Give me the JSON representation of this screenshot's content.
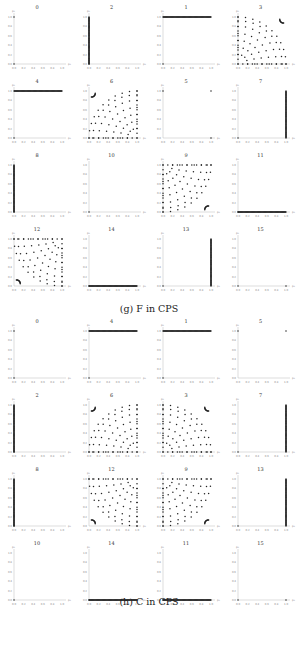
{
  "figure_g": {
    "caption": "(g) F in CPS",
    "panel_titles": [
      "0",
      "2",
      "1",
      "3",
      "4",
      "6",
      "5",
      "7",
      "8",
      "10",
      "9",
      "11",
      "12",
      "14",
      "13",
      "15"
    ]
  },
  "figure_h": {
    "caption": "(h) C in CPS",
    "panel_titles": [
      "0",
      "4",
      "1",
      "5",
      "2",
      "6",
      "3",
      "7",
      "8",
      "12",
      "9",
      "13",
      "10",
      "14",
      "11",
      "15"
    ]
  },
  "axes": {
    "x_label": "p₁",
    "y_label": "p₂",
    "x_ticks": [
      "0.0",
      "0.2",
      "0.4",
      "0.6",
      "0.8",
      "1.0"
    ],
    "y_ticks": [
      "0.0",
      "0.2",
      "0.4",
      "0.6",
      "0.8",
      "1.0"
    ]
  },
  "chart_data": [
    {
      "type": "scatter",
      "title": "(g) F in CPS",
      "xlabel": "p1",
      "ylabel": "p2",
      "xlim": [
        0,
        1
      ],
      "ylim": [
        0,
        1
      ],
      "grid": false,
      "panels": [
        {
          "title": "0",
          "pattern": "two corner points",
          "points": [
            [
              0,
              1
            ],
            [
              0,
              0
            ]
          ]
        },
        {
          "title": "2",
          "pattern": "vertical line x=0",
          "points": [
            [
              0,
              0
            ],
            [
              0,
              1
            ]
          ]
        },
        {
          "title": "1",
          "pattern": "horizontal line y=1",
          "points": [
            [
              0,
              1
            ],
            [
              1,
              1
            ]
          ]
        },
        {
          "title": "3",
          "pattern": "quarter-circle arcs concentrated near (1,1)",
          "points": []
        },
        {
          "title": "4",
          "pattern": "horizontal line y=1",
          "points": [
            [
              0,
              1
            ],
            [
              1,
              1
            ]
          ]
        },
        {
          "title": "6",
          "pattern": "quarter-circle arcs concentrated near (0,1)",
          "points": []
        },
        {
          "title": "5",
          "pattern": "corner points",
          "points": [
            [
              0,
              1
            ],
            [
              1,
              1
            ],
            [
              1,
              0
            ]
          ]
        },
        {
          "title": "7",
          "pattern": "vertical line x=1",
          "points": [
            [
              1,
              0
            ],
            [
              1,
              1
            ]
          ]
        },
        {
          "title": "8",
          "pattern": "vertical line x=0",
          "points": [
            [
              0,
              0
            ],
            [
              0,
              1
            ]
          ]
        },
        {
          "title": "10",
          "pattern": "single corner point",
          "points": [
            [
              0,
              0
            ]
          ]
        },
        {
          "title": "9",
          "pattern": "quarter-circle arcs concentrated near (1,0)",
          "points": []
        },
        {
          "title": "11",
          "pattern": "horizontal line y=0",
          "points": [
            [
              0,
              0
            ],
            [
              1,
              0
            ]
          ]
        },
        {
          "title": "12",
          "pattern": "quarter-circle arcs concentrated near (0,0)",
          "points": []
        },
        {
          "title": "14",
          "pattern": "horizontal line y=0",
          "points": [
            [
              0,
              0
            ],
            [
              1,
              0
            ]
          ]
        },
        {
          "title": "13",
          "pattern": "vertical line x=1",
          "points": [
            [
              1,
              0
            ],
            [
              1,
              1
            ]
          ]
        },
        {
          "title": "15",
          "pattern": "two corner points",
          "points": [
            [
              0,
              0
            ],
            [
              1,
              0
            ]
          ]
        }
      ]
    },
    {
      "type": "scatter",
      "title": "(h) C in CPS",
      "xlabel": "p1",
      "ylabel": "p2",
      "xlim": [
        0,
        1
      ],
      "ylim": [
        0,
        1
      ],
      "grid": false,
      "panels": [
        {
          "title": "0",
          "pattern": "two corner points",
          "points": [
            [
              0,
              1
            ],
            [
              0,
              0
            ]
          ]
        },
        {
          "title": "4",
          "pattern": "horizontal line y=1",
          "points": [
            [
              0,
              1
            ],
            [
              1,
              1
            ]
          ]
        },
        {
          "title": "1",
          "pattern": "horizontal line y=1",
          "points": [
            [
              0,
              1
            ],
            [
              1,
              1
            ]
          ]
        },
        {
          "title": "5",
          "pattern": "corner points",
          "points": [
            [
              0,
              1
            ],
            [
              1,
              1
            ]
          ]
        },
        {
          "title": "2",
          "pattern": "vertical line x=0",
          "points": [
            [
              0,
              0
            ],
            [
              0,
              1
            ]
          ]
        },
        {
          "title": "6",
          "pattern": "quarter-circle arcs concentrated near (0,1)",
          "points": []
        },
        {
          "title": "3",
          "pattern": "quarter-circle arcs concentrated near (1,1)",
          "points": []
        },
        {
          "title": "7",
          "pattern": "vertical line x=1",
          "points": [
            [
              1,
              0
            ],
            [
              1,
              1
            ]
          ]
        },
        {
          "title": "8",
          "pattern": "vertical line x=0",
          "points": [
            [
              0,
              0
            ],
            [
              0,
              1
            ]
          ]
        },
        {
          "title": "12",
          "pattern": "quarter-circle arcs concentrated near (0,0)",
          "points": []
        },
        {
          "title": "9",
          "pattern": "quarter-circle arcs concentrated near (1,0)",
          "points": []
        },
        {
          "title": "13",
          "pattern": "vertical line x=1",
          "points": [
            [
              1,
              0
            ],
            [
              1,
              1
            ]
          ]
        },
        {
          "title": "10",
          "pattern": "single corner point",
          "points": [
            [
              0,
              0
            ]
          ]
        },
        {
          "title": "14",
          "pattern": "horizontal line y=0",
          "points": [
            [
              0,
              0
            ],
            [
              1,
              0
            ]
          ]
        },
        {
          "title": "11",
          "pattern": "horizontal line y=0",
          "points": [
            [
              0,
              0
            ],
            [
              1,
              0
            ]
          ]
        },
        {
          "title": "15",
          "pattern": "two corner points",
          "points": [
            [
              0,
              0
            ],
            [
              1,
              0
            ]
          ]
        }
      ]
    }
  ]
}
